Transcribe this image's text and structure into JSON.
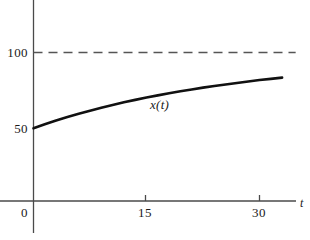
{
  "chart_data": {
    "type": "line",
    "title": "",
    "subtitle": "",
    "xlabel": "t",
    "ylabel": "",
    "xlim": [
      -2,
      34
    ],
    "ylim": [
      0,
      118
    ],
    "grid": false,
    "legend": null,
    "x_ticks": [
      {
        "value": 0,
        "label": "0"
      },
      {
        "value": 15,
        "label": "15"
      },
      {
        "value": 30,
        "label": "30"
      }
    ],
    "y_ticks": [
      {
        "value": 50,
        "label": "50"
      },
      {
        "value": 100,
        "label": "100"
      }
    ],
    "annotations": [
      {
        "name": "curve-label",
        "text": "x(t)",
        "x": 16.5,
        "y": 74
      }
    ],
    "series": [
      {
        "name": "x(t)",
        "style": "solid",
        "color": "#111111",
        "width": 2.6,
        "x": [
          0,
          1.5,
          3,
          4.5,
          6,
          7.5,
          9,
          10.5,
          12,
          13.5,
          15,
          16.5,
          18,
          19.5,
          21,
          22.5,
          24,
          25.5,
          27,
          28.5,
          30,
          31.5,
          33
        ],
        "values": [
          50.0,
          52.6,
          55.1,
          57.4,
          59.5,
          61.6,
          63.5,
          65.3,
          67.1,
          68.7,
          70.3,
          71.7,
          73.1,
          74.4,
          75.6,
          76.8,
          77.9,
          78.9,
          79.9,
          80.9,
          81.8,
          82.6,
          83.4
        ]
      },
      {
        "name": "asymptote",
        "style": "dashed",
        "color": "#555555",
        "width": 1.4,
        "x": [
          0,
          34.8
        ],
        "values": [
          100,
          100
        ]
      }
    ]
  },
  "axes": {
    "x_axis_name": "t",
    "y_axis_name": ""
  },
  "labels": {
    "y_100": "100",
    "y_50": "50",
    "x_0": "0",
    "x_15": "15",
    "x_30": "30",
    "curve": "x(t)",
    "t_axis": "t"
  },
  "colors": {
    "curve": "#111111",
    "asymptote": "#555555",
    "axis": "#4a4a4a",
    "text": "#1a1a1a",
    "background": "#ffffff"
  }
}
